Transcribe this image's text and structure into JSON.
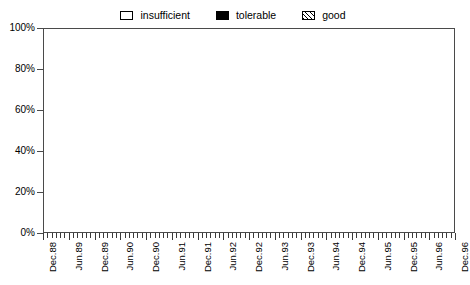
{
  "chart_data": {
    "type": "area",
    "stacked": true,
    "title": "",
    "subtitle": "",
    "xlabel": "",
    "ylabel": "",
    "ylim": [
      0,
      100
    ],
    "ytick_labels": [
      "0%",
      "20%",
      "40%",
      "60%",
      "80%",
      "100%"
    ],
    "ytick_values": [
      0,
      20,
      40,
      60,
      80,
      100
    ],
    "grid": false,
    "legend_position": "top-center",
    "legend_entries": [
      {
        "label": "insufficient",
        "marker": "empty-box",
        "color": "#ffffff"
      },
      {
        "label": "tolerable",
        "marker": "filled-box",
        "color": "#000000"
      },
      {
        "label": "good",
        "marker": "hatched-box",
        "color": "#e8e8e8"
      }
    ],
    "x_tick_interval_months": 1,
    "x_label_interval_months": 6,
    "x": [
      "Dec.88",
      "Jan.89",
      "Feb.89",
      "Mar.89",
      "Apr.89",
      "May.89",
      "Jun.89",
      "Jul.89",
      "Aug.89",
      "Sep.89",
      "Oct.89",
      "Nov.89",
      "Dec.89",
      "Jan.90",
      "Feb.90",
      "Mar.90",
      "Apr.90",
      "May.90",
      "Jun.90",
      "Jul.90",
      "Aug.90",
      "Sep.90",
      "Oct.90",
      "Nov.90",
      "Dec.90",
      "Jan.91",
      "Feb.91",
      "Mar.91",
      "Apr.91",
      "May.91",
      "Jun.91",
      "Jul.91",
      "Aug.91",
      "Sep.91",
      "Oct.91",
      "Nov.91",
      "Dec.91",
      "Jan.92",
      "Feb.92",
      "Mar.92",
      "Apr.92",
      "May.92",
      "Jun.92",
      "Jul.92",
      "Aug.92",
      "Sep.92",
      "Oct.92",
      "Nov.92",
      "Dec.92",
      "Jan.93",
      "Feb.93",
      "Mar.93",
      "Apr.93",
      "May.93",
      "Jun.93",
      "Jul.93",
      "Aug.93",
      "Sep.93",
      "Oct.93",
      "Nov.93",
      "Dec.93",
      "Jan.94",
      "Feb.94",
      "Mar.94",
      "Apr.94",
      "May.94",
      "Jun.94",
      "Jul.94",
      "Aug.94",
      "Sep.94",
      "Oct.94",
      "Nov.94",
      "Dec.94",
      "Jan.95",
      "Feb.95",
      "Mar.95",
      "Apr.95",
      "May.95",
      "Jun.95",
      "Jul.95",
      "Aug.95",
      "Sep.95",
      "Oct.95",
      "Nov.95",
      "Dec.95",
      "Jan.96",
      "Feb.96",
      "Mar.96",
      "Apr.96",
      "May.96",
      "Jun.96",
      "Jul.96",
      "Aug.96",
      "Sep.96",
      "Oct.96",
      "Nov.96",
      "Dec.96"
    ],
    "x_major_labels": [
      "Dec.88",
      "Jun.89",
      "Dec.89",
      "Jun.90",
      "Dec.90",
      "Jun.91",
      "Dec.91",
      "Jun.92",
      "Dec.92",
      "Jun.93",
      "Dec.93",
      "Jun.94",
      "Dec.94",
      "Jun.95",
      "Dec.95",
      "Jun.96",
      "Dec.96"
    ],
    "series": [
      {
        "name": "good",
        "values": [
          45,
          41,
          47,
          43,
          42,
          52,
          56,
          58,
          60,
          64,
          67,
          70,
          72,
          75,
          78,
          74,
          72,
          70,
          68,
          71,
          75,
          73,
          74,
          72,
          70,
          73,
          76,
          78,
          80,
          79,
          78,
          72,
          68,
          65,
          64,
          67,
          72,
          76,
          79,
          81,
          80,
          78,
          75,
          72,
          70,
          71,
          74,
          78,
          80,
          78,
          76,
          73,
          71,
          70,
          69,
          72,
          76,
          79,
          81,
          83,
          85,
          84,
          82,
          80,
          78,
          80,
          82,
          83,
          81,
          79,
          75,
          70,
          64,
          60,
          58,
          62,
          66,
          70,
          72,
          68,
          64,
          61,
          66,
          72,
          76,
          74,
          71,
          74,
          78,
          80,
          82,
          84,
          83,
          81,
          84,
          86,
          87
        ]
      },
      {
        "name": "tolerable",
        "values": [
          11,
          13,
          10,
          12,
          13,
          10,
          10,
          10,
          10,
          9,
          9,
          9,
          9,
          9,
          8,
          9,
          10,
          11,
          11,
          10,
          9,
          10,
          9,
          10,
          11,
          10,
          9,
          8,
          8,
          8,
          8,
          10,
          11,
          12,
          12,
          11,
          9,
          8,
          7,
          7,
          7,
          8,
          9,
          10,
          11,
          10,
          9,
          8,
          7,
          8,
          9,
          10,
          11,
          11,
          11,
          10,
          9,
          8,
          7,
          7,
          6,
          6,
          7,
          8,
          9,
          8,
          7,
          7,
          8,
          9,
          10,
          12,
          14,
          15,
          15,
          13,
          11,
          9,
          8,
          10,
          12,
          13,
          11,
          9,
          8,
          9,
          10,
          9,
          8,
          7,
          7,
          6,
          7,
          8,
          7,
          6,
          6
        ]
      },
      {
        "name": "insufficient",
        "values": [
          44,
          46,
          43,
          45,
          45,
          38,
          34,
          32,
          30,
          27,
          24,
          21,
          19,
          16,
          14,
          17,
          18,
          19,
          21,
          19,
          16,
          17,
          17,
          18,
          19,
          17,
          15,
          14,
          12,
          13,
          14,
          18,
          21,
          23,
          24,
          22,
          19,
          16,
          14,
          12,
          13,
          14,
          16,
          18,
          19,
          19,
          17,
          14,
          13,
          14,
          15,
          17,
          18,
          19,
          20,
          18,
          15,
          13,
          12,
          10,
          9,
          10,
          11,
          12,
          13,
          12,
          11,
          10,
          11,
          12,
          15,
          18,
          22,
          25,
          27,
          25,
          23,
          21,
          20,
          22,
          24,
          26,
          23,
          19,
          16,
          17,
          19,
          17,
          14,
          13,
          11,
          10,
          10,
          11,
          9,
          8,
          7
        ]
      }
    ]
  }
}
